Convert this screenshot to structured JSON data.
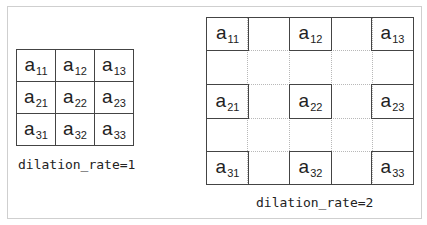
{
  "diagram": {
    "left": {
      "caption": "dilation_rate=1",
      "rows": [
        [
          {
            "base": "a",
            "sub": "11"
          },
          {
            "base": "a",
            "sub": "12"
          },
          {
            "base": "a",
            "sub": "13"
          }
        ],
        [
          {
            "base": "a",
            "sub": "21"
          },
          {
            "base": "a",
            "sub": "22"
          },
          {
            "base": "a",
            "sub": "23"
          }
        ],
        [
          {
            "base": "a",
            "sub": "31"
          },
          {
            "base": "a",
            "sub": "32"
          },
          {
            "base": "a",
            "sub": "33"
          }
        ]
      ]
    },
    "right": {
      "caption": "dilation_rate=2",
      "rows": [
        [
          {
            "base": "a",
            "sub": "11"
          },
          {
            "base": "a",
            "sub": "12"
          },
          {
            "base": "a",
            "sub": "13"
          }
        ],
        [
          {
            "base": "a",
            "sub": "21"
          },
          {
            "base": "a",
            "sub": "22"
          },
          {
            "base": "a",
            "sub": "23"
          }
        ],
        [
          {
            "base": "a",
            "sub": "31"
          },
          {
            "base": "a",
            "sub": "32"
          },
          {
            "base": "a",
            "sub": "33"
          }
        ]
      ]
    }
  }
}
